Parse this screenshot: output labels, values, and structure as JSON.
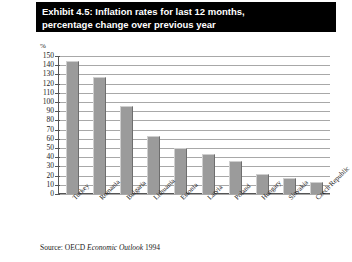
{
  "figure": {
    "title_line1": "Exhibit 4.5: Inflation rates for last 12 months,",
    "title_line2": "percentage change over previous year",
    "credit": "Reproduced by permission of the OECD",
    "source_prefix": "Source: OECD ",
    "source_italic": "Economic Outlook",
    "source_suffix": " 1994",
    "axis_unit": "%",
    "bar_color": "#9b9b9b",
    "title_bg": "#000000",
    "title_fg": "#ffffff",
    "grid_color": "#a8a8a8",
    "axis_color": "#555555"
  },
  "chart_data": {
    "type": "bar",
    "title": "Exhibit 4.5: Inflation rates for last 12 months, percentage change over previous year",
    "xlabel": "",
    "ylabel": "%",
    "ylim": [
      0,
      150
    ],
    "ytick_step": 10,
    "grid": true,
    "legend": "none",
    "categories": [
      "Turkey",
      "Romania",
      "Bulgaria",
      "Lithuania",
      "Estonia",
      "Latvia",
      "Poland",
      "Hungary",
      "Slovakia",
      "Czech Republic"
    ],
    "values": [
      145,
      127,
      96,
      63,
      50,
      44,
      36,
      22,
      17,
      13
    ],
    "tick_labels": [
      "150",
      "140",
      "130",
      "120",
      "110",
      "100",
      "90",
      "80",
      "70",
      "60",
      "50",
      "40",
      "30",
      "20",
      "10",
      "0"
    ]
  }
}
